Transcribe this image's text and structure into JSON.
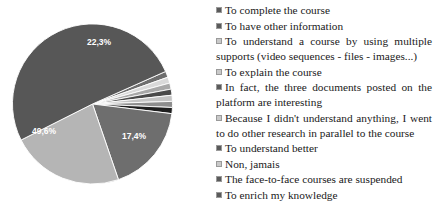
{
  "chart_data": {
    "type": "pie",
    "title": "",
    "labels": [
      "To complete the course",
      "To have other information",
      "To understand a course by using multiple supports (video sequences - files - images...)",
      "To explain the course",
      "In fact, the three documents posted on the platform are interesting",
      "Because I didn't understand anything, I went to do other research in parallel to the course",
      "To understand better",
      "Non, jamais",
      "The face-to-face courses are suspended",
      "To enrich my knowledge"
    ],
    "values": [
      1.2,
      1.2,
      1.2,
      1.2,
      1.2,
      1.2,
      1.2,
      17.4,
      22.3,
      49.6
    ],
    "visible_labels": [
      "22,3%",
      "17,4%",
      "49,6%"
    ],
    "slice_colors": [
      "#6e6e6e",
      "#d9d9d9",
      "#a8a8a8",
      "#4a4a4a",
      "#c4c4c4",
      "#8d8d8d",
      "#1e1e1e",
      "#6e6e6e",
      "#b5b5b5",
      "#575757"
    ],
    "legend_position": "right",
    "grid": false
  },
  "legend": {
    "items": [
      {
        "label": "To complete the course",
        "color": "#5a5a5a",
        "multiline": false
      },
      {
        "label": "To have other information",
        "color": "#5a5a5a",
        "multiline": false
      },
      {
        "label": "To understand a course by using multiple supports (video sequences - files - images...)",
        "color": "#c9c9c9",
        "multiline": true
      },
      {
        "label": "To explain the course",
        "color": "#c9c9c9",
        "multiline": false
      },
      {
        "label": "In fact, the three documents posted on the platform are interesting",
        "color": "#5a5a5a",
        "multiline": true
      },
      {
        "label": "Because I didn't understand anything, I went to do other research in parallel to the course",
        "color": "#c9c9c9",
        "multiline": true
      },
      {
        "label": "To understand better",
        "color": "#5a5a5a",
        "multiline": false
      },
      {
        "label": "Non, jamais",
        "color": "#c9c9c9",
        "multiline": false
      },
      {
        "label": "The face-to-face courses are suspended",
        "color": "#5a5a5a",
        "multiline": false
      },
      {
        "label": "To enrich my knowledge",
        "color": "#5a5a5a",
        "multiline": false
      }
    ]
  },
  "pie": {
    "labels": [
      {
        "text": "22,3%",
        "x": 99,
        "y": 43
      },
      {
        "text": "17,4%",
        "x": 134,
        "y": 137
      },
      {
        "text": "49,6%",
        "x": 44,
        "y": 132
      }
    ]
  }
}
